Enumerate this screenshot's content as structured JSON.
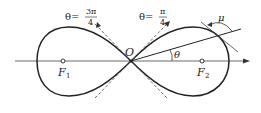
{
  "diagram": {
    "labels": {
      "origin": "O",
      "f1": "F",
      "f1_sub": "1",
      "f2": "F",
      "f2_sub": "2",
      "theta": "θ",
      "mu": "μ",
      "theta_3pi4_prefix": "θ=",
      "theta_3pi4_num": "3π",
      "theta_3pi4_den": "4",
      "theta_pi4_prefix": "θ=",
      "theta_pi4_num": "π",
      "theta_pi4_den": "4"
    },
    "colors": {
      "stroke": "#222222",
      "background": "#ffffff"
    }
  }
}
